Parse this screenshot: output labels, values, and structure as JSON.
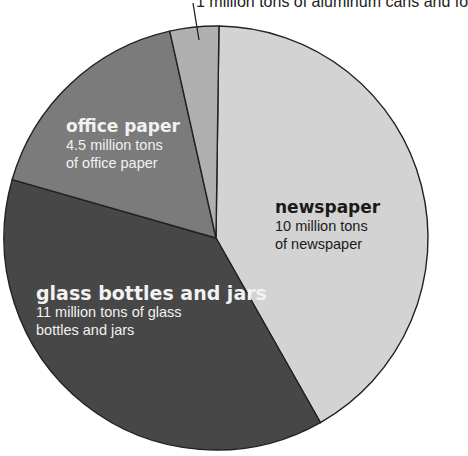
{
  "chart_data": {
    "type": "pie",
    "title": "",
    "unit": "million tons",
    "start_angle_deg": 0,
    "direction": "clockwise",
    "slices": [
      {
        "name": "newspaper",
        "value": 10,
        "description": "10 million tons\nof newspaper",
        "color": "#d3d3d3"
      },
      {
        "name": "glass bottles and jars",
        "value": 11,
        "description": "11 million tons of glass\nbottles and jars",
        "color": "#474747"
      },
      {
        "name": "office paper",
        "value": 4.5,
        "description": "4.5 million tons\nof office paper",
        "color": "#7b7b7b"
      },
      {
        "name": "aluminum cans and foil",
        "value": 1,
        "description": "1 million tons of aluminum cans and foil",
        "color": "#b0b0b0"
      }
    ],
    "categories": [
      "newspaper",
      "glass bottles and jars",
      "office paper",
      "aluminum cans and foil"
    ],
    "values": [
      10,
      11,
      4.5,
      1
    ],
    "legend": "none (direct labels)"
  },
  "labels": {
    "top_callout": "1 million tons of aluminum cans and fo",
    "newspaper_title": "newspaper",
    "newspaper_desc": "10 million tons\nof newspaper",
    "glass_title": "glass bottles and jars",
    "glass_desc": "11 million tons of glass\nbottles and jars",
    "office_title": "office paper",
    "office_desc": "4.5 million tons\nof office paper"
  }
}
